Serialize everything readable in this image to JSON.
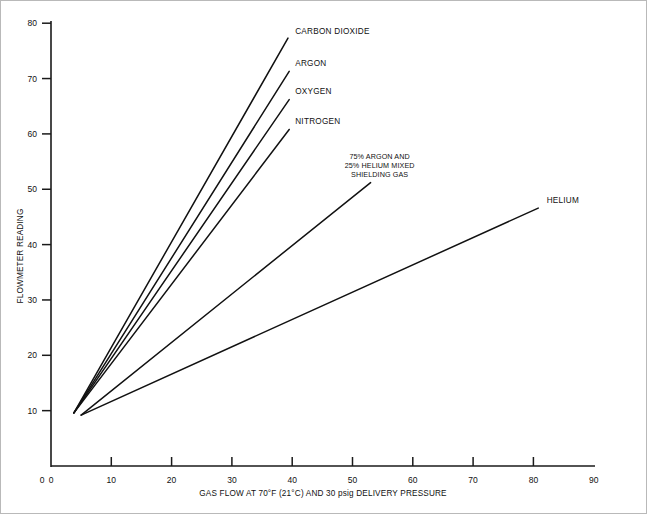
{
  "chart_data": {
    "type": "line",
    "title": "",
    "xlabel": "GAS FLOW AT 70°F (21°C) AND 30 psig DELIVERY PRESSURE",
    "ylabel": "FLOWMETER READING",
    "xlim": [
      0,
      90
    ],
    "ylim": [
      0,
      80
    ],
    "xticks": [
      0,
      10,
      20,
      30,
      40,
      50,
      60,
      70,
      80,
      90
    ],
    "yticks": [
      0,
      10,
      20,
      30,
      40,
      50,
      60,
      70,
      80
    ],
    "grid": false,
    "legend": "inline-end-labels",
    "line_color": "#111111",
    "series": [
      {
        "name": "CARBON DIOXIDE",
        "label": [
          "CARBON DIOXIDE"
        ],
        "x": [
          3.8,
          39.3
        ],
        "y": [
          9.6,
          77.3
        ],
        "label_x": 40.5,
        "label_y": 78.0
      },
      {
        "name": "ARGON",
        "label": [
          "ARGON"
        ],
        "x": [
          3.8,
          39.5
        ],
        "y": [
          9.6,
          71.3
        ],
        "label_x": 40.5,
        "label_y": 72.2
      },
      {
        "name": "OXYGEN",
        "label": [
          "OXYGEN"
        ],
        "x": [
          3.8,
          39.5
        ],
        "y": [
          9.6,
          66.2
        ],
        "label_x": 40.5,
        "label_y": 67.2
      },
      {
        "name": "NITROGEN",
        "label": [
          "NITROGEN"
        ],
        "x": [
          3.8,
          39.5
        ],
        "y": [
          9.6,
          60.8
        ],
        "label_x": 40.5,
        "label_y": 61.8
      },
      {
        "name": "75% ARGON AND 25% HELIUM MIXED SHIELDING GAS",
        "label": [
          "75% ARGON AND",
          "25% HELIUM MIXED",
          "SHIELDING GAS"
        ],
        "x": [
          5.0,
          53.0
        ],
        "y": [
          9.2,
          51.2
        ],
        "label_x": 54.5,
        "label_y": 55.5
      },
      {
        "name": "HELIUM",
        "label": [
          "HELIUM"
        ],
        "x": [
          5.0,
          80.8
        ],
        "y": [
          9.2,
          46.6
        ],
        "label_x": 82.2,
        "label_y": 47.6
      }
    ]
  }
}
